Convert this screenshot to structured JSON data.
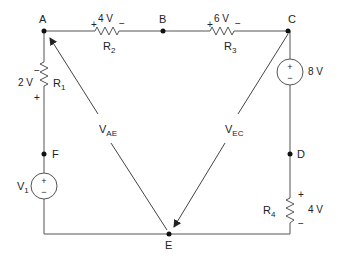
{
  "nodes": {
    "A": "A",
    "B": "B",
    "C": "C",
    "D": "D",
    "E": "E",
    "F": "F"
  },
  "components": {
    "R1": {
      "name": "R",
      "sub": "1",
      "voltage": "2 V",
      "plus": "+",
      "minus": "−"
    },
    "R2": {
      "name": "R",
      "sub": "2",
      "voltage": "4 V",
      "plus": "+",
      "minus": "−"
    },
    "R3": {
      "name": "R",
      "sub": "3",
      "voltage": "6 V",
      "plus": "+",
      "minus": "−"
    },
    "R4": {
      "name": "R",
      "sub": "4",
      "voltage": "4 V",
      "plus": "+",
      "minus": "−"
    },
    "V1": {
      "name": "V",
      "sub": "1",
      "plus": "+",
      "minus": "−"
    },
    "Vsrc_CD": {
      "voltage": "8 V",
      "plus": "+",
      "minus": "−"
    }
  },
  "vectors": {
    "VAE": {
      "name": "V",
      "sub": "AE"
    },
    "VEC": {
      "name": "V",
      "sub": "EC"
    }
  },
  "colors": {
    "line": "#333333",
    "text": "#222222",
    "background": "#ffffff"
  }
}
